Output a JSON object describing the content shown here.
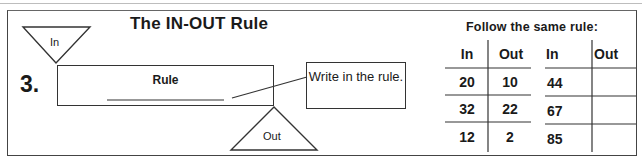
{
  "worksheet": {
    "title": "The IN-OUT Rule",
    "problem_number": "3.",
    "in_triangle_label": "In",
    "out_triangle_label": "Out",
    "rule_box_label": "Rule",
    "callout_text": "Write in the rule.",
    "follow_instruction": "Follow the same rule:"
  },
  "table_left": {
    "headers": [
      "In",
      "Out"
    ],
    "rows": [
      {
        "in": "20",
        "out": "10"
      },
      {
        "in": "32",
        "out": "22"
      },
      {
        "in": "12",
        "out": "2"
      }
    ]
  },
  "table_right": {
    "headers": [
      "In",
      "Out"
    ],
    "rows": [
      {
        "in": "44",
        "out": ""
      },
      {
        "in": "67",
        "out": ""
      },
      {
        "in": "85",
        "out": ""
      }
    ]
  }
}
